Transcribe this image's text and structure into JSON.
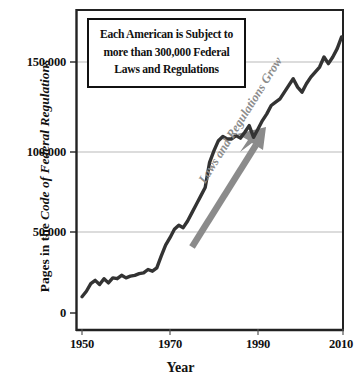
{
  "figure": {
    "background_color": "#ffffff",
    "line_color": "#333333",
    "arrow_color": "#8b8b8b",
    "grid_color": "#b9b9b9",
    "axis_color": "#222222"
  },
  "callout": {
    "name": "callout-box",
    "line1": "Each American is Subject to",
    "line2": "more than 300,000 Federal",
    "line3": "Laws and Regulations"
  },
  "annotation": {
    "arrow_label": "Laws and Regulations Grow",
    "arrow_icon": "up-right-arrow-icon"
  },
  "axes": {
    "y_title_plain": "Pages in the ",
    "y_title_italic": "Code of Federal Regulations",
    "x_title": "Year",
    "y_ticks": [
      "0",
      "50,000",
      "100,000",
      "150,000"
    ],
    "x_ticks": [
      "1950",
      "1970",
      "1990",
      "2010"
    ]
  },
  "chart_data": {
    "type": "line",
    "title": "",
    "subtitle": "",
    "xlabel": "Year",
    "ylabel": "Pages in the Code of Federal Regulations",
    "xlim": [
      1948,
      2011
    ],
    "ylim": [
      0,
      170000
    ],
    "xticks": [
      1950,
      1970,
      1990,
      2010
    ],
    "yticks": [
      0,
      50000,
      100000,
      150000
    ],
    "ytick_labels": [
      "0",
      "50,000",
      "100,000",
      "150,000"
    ],
    "xtick_labels": [
      "1950",
      "1970",
      "1990",
      "2010"
    ],
    "grid": "horizontal",
    "legend": "none",
    "annotations": [
      {
        "type": "textbox",
        "text": "Each American is Subject to more than 300,000 Federal Laws and Regulations"
      },
      {
        "type": "arrow",
        "text": "Laws and Regulations Grow",
        "direction": "up-right"
      }
    ],
    "series": [
      {
        "name": "Pages in the Code of Federal Regulations",
        "color": "#333333",
        "x": [
          1950,
          1951,
          1952,
          1953,
          1954,
          1955,
          1956,
          1957,
          1958,
          1959,
          1960,
          1961,
          1962,
          1963,
          1964,
          1965,
          1966,
          1967,
          1968,
          1969,
          1970,
          1971,
          1972,
          1973,
          1974,
          1975,
          1976,
          1977,
          1978,
          1979,
          1980,
          1981,
          1982,
          1983,
          1984,
          1985,
          1986,
          1987,
          1988,
          1989,
          1990,
          1991,
          1992,
          1993,
          1994,
          1995,
          1996,
          1997,
          1998,
          1999,
          2000,
          2001,
          2002,
          2003,
          2004,
          2005,
          2006,
          2007,
          2008,
          2009
        ],
        "values": [
          9700,
          13000,
          17500,
          19500,
          17000,
          20500,
          18000,
          21000,
          20500,
          22500,
          21000,
          22000,
          22500,
          23500,
          24000,
          26000,
          25000,
          27000,
          34000,
          40500,
          45000,
          50000,
          52500,
          51000,
          55000,
          60000,
          65000,
          70000,
          75000,
          90000,
          97000,
          103000,
          105500,
          104000,
          104000,
          106000,
          104500,
          108000,
          112000,
          105000,
          110000,
          115000,
          119000,
          124000,
          126000,
          128000,
          132000,
          136000,
          140000,
          135000,
          132000,
          137000,
          141000,
          144000,
          147000,
          153000,
          149000,
          153000,
          158000,
          165000
        ]
      }
    ]
  }
}
